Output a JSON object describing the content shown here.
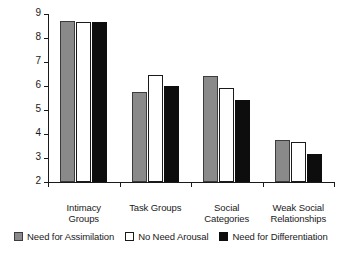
{
  "chart_data": {
    "type": "bar",
    "title": "",
    "xlabel": "",
    "ylabel": "Perceived Group Importance",
    "ylim": [
      2,
      9
    ],
    "yticks": [
      2,
      3,
      4,
      5,
      6,
      7,
      8,
      9
    ],
    "ytick_labels": [
      "2",
      "3",
      "4",
      "5",
      "6",
      "7",
      "8",
      "9"
    ],
    "grid": false,
    "legend_position": "bottom",
    "categories": [
      "Intimacy\nGroups",
      "Task Groups",
      "Social\nCategories",
      "Weak Social\nRelationships"
    ],
    "series": [
      {
        "name": "Need for Assimilation",
        "color": "#8a8a8a",
        "values": [
          8.7,
          5.75,
          6.4,
          3.75
        ]
      },
      {
        "name": "No Need Arousal",
        "color": "#ffffff",
        "values": [
          8.65,
          6.45,
          5.9,
          3.65
        ]
      },
      {
        "name": "Need for Differentiation",
        "color": "#0d0d0d",
        "values": [
          8.65,
          6.0,
          5.4,
          3.15
        ]
      }
    ]
  }
}
